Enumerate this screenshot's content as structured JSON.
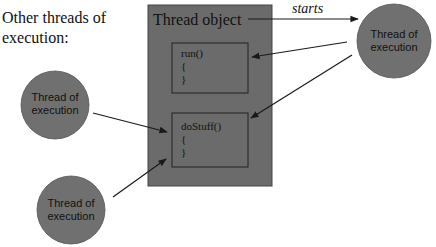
{
  "caption": {
    "line1": "Other threads of",
    "line2": "execution:"
  },
  "thread_object": {
    "title": "Thread object",
    "fill": "#6b6b6b",
    "methods": [
      {
        "name": "run()",
        "open_brace": "{",
        "close_brace": "}"
      },
      {
        "name": "doStuff()",
        "open_brace": "{",
        "close_brace": "}"
      }
    ]
  },
  "starts_label": "starts",
  "threads": [
    {
      "id": "main-thread",
      "line1": "Thread of",
      "line2": "execution"
    },
    {
      "id": "other-thread-1",
      "line1": "Thread of",
      "line2": "execution"
    },
    {
      "id": "other-thread-2",
      "line1": "Thread of",
      "line2": "execution"
    }
  ],
  "colors": {
    "circle_fill": "#707070",
    "box_fill": "#6b6b6b",
    "stroke": "#1a1a1a",
    "text": "#111111"
  }
}
